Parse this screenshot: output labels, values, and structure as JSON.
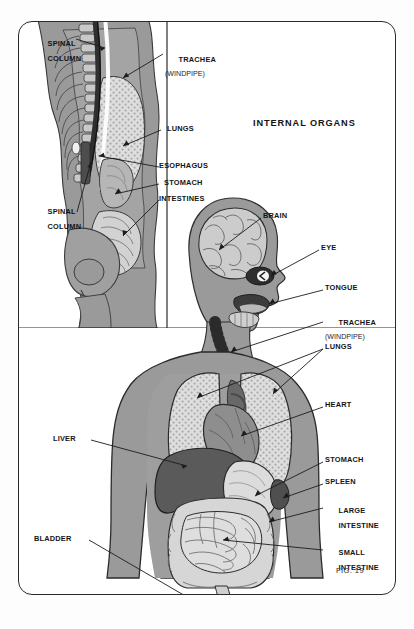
{
  "figure": {
    "title": "INTERNAL ORGANS",
    "caption": "FIG. 19",
    "frame_color": "#2b2b2b",
    "body_color": "#9a9a9a",
    "organ_dark": "#5a5a5a",
    "organ_mid": "#8a8a8a",
    "organ_light": "#dcdcdc",
    "line_color": "#1c1c1c"
  },
  "inset": {
    "name": "side-view-torso-inset",
    "labels": [
      {
        "id": "spinal-column-top",
        "text": "SPINAL",
        "text2": "COLUMN",
        "sub": ""
      },
      {
        "id": "trachea-inset",
        "text": "TRACHEA",
        "text2": "",
        "sub": "(WINDPIPE)"
      },
      {
        "id": "lungs-inset",
        "text": "LUNGS",
        "text2": "",
        "sub": ""
      },
      {
        "id": "esophagus-inset",
        "text": "ESOPHAGUS",
        "text2": "",
        "sub": ""
      },
      {
        "id": "stomach-inset",
        "text": "STOMACH",
        "text2": "",
        "sub": ""
      },
      {
        "id": "intestines-inset",
        "text": "INTESTINES",
        "text2": "",
        "sub": ""
      },
      {
        "id": "spinal-column-bottom",
        "text": "SPINAL",
        "text2": "COLUMN",
        "sub": ""
      }
    ]
  },
  "main": {
    "name": "front-view-body-main",
    "labels": [
      {
        "id": "brain",
        "text": "BRAIN",
        "text2": "",
        "sub": ""
      },
      {
        "id": "eye",
        "text": "EYE",
        "text2": "",
        "sub": ""
      },
      {
        "id": "tongue",
        "text": "TONGUE",
        "text2": "",
        "sub": ""
      },
      {
        "id": "trachea",
        "text": "TRACHEA",
        "text2": "",
        "sub": "(WINDPIPE)"
      },
      {
        "id": "lungs",
        "text": "LUNGS",
        "text2": "",
        "sub": ""
      },
      {
        "id": "heart",
        "text": "HEART",
        "text2": "",
        "sub": ""
      },
      {
        "id": "stomach",
        "text": "STOMACH",
        "text2": "",
        "sub": ""
      },
      {
        "id": "spleen",
        "text": "SPLEEN",
        "text2": "",
        "sub": ""
      },
      {
        "id": "large-intestine",
        "text": "LARGE",
        "text2": "INTESTINE",
        "sub": ""
      },
      {
        "id": "small-intestine",
        "text": "SMALL",
        "text2": "INTESTINE",
        "sub": ""
      },
      {
        "id": "liver",
        "text": "LIVER",
        "text2": "",
        "sub": ""
      },
      {
        "id": "bladder",
        "text": "BLADDER",
        "text2": "",
        "sub": ""
      }
    ]
  }
}
